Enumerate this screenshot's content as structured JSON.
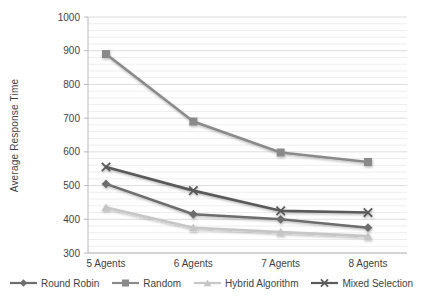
{
  "chart_data": {
    "type": "line",
    "title": "",
    "ylabel": "Average Response Time",
    "xlabel": "",
    "categories": [
      "5 Agents",
      "6 Agents",
      "7 Agents",
      "8 Agents"
    ],
    "series": [
      {
        "name": "Round Robin",
        "marker": "diamond",
        "color": "#6d6d6d",
        "values": [
          505,
          415,
          400,
          375
        ]
      },
      {
        "name": "Random",
        "marker": "square",
        "color": "#8a8a8a",
        "values": [
          890,
          690,
          598,
          570
        ]
      },
      {
        "name": "Hybrid Algorithm",
        "marker": "triangle",
        "color": "#c6c6c6",
        "values": [
          435,
          375,
          362,
          350
        ]
      },
      {
        "name": "Mixed Selection",
        "marker": "x",
        "color": "#5a5a5a",
        "values": [
          555,
          485,
          425,
          420
        ]
      }
    ],
    "ylim": [
      300,
      1000
    ],
    "y_ticks": [
      1000,
      900,
      800,
      700,
      600,
      500,
      400,
      300
    ],
    "y_minor_step": 20,
    "y_major_step": 100,
    "grid": true,
    "legend_position": "bottom"
  },
  "colors": {
    "axis": "#b9b9b9",
    "grid_major": "#dcdcdc",
    "grid_minor": "#eeeeee",
    "text": "#3f3f3f"
  }
}
